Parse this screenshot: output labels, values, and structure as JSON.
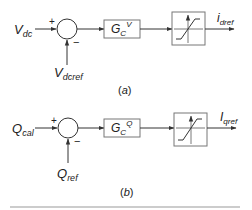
{
  "diagrams": [
    {
      "caption": "(a)",
      "input": {
        "main": "V",
        "sub": "dc"
      },
      "reference": {
        "main": "V",
        "sub": "dcref"
      },
      "sum_signs": {
        "top": "+",
        "bottom": "−"
      },
      "controller": {
        "main": "G",
        "sub": "C",
        "sup": "V"
      },
      "limiter": "saturation",
      "output": {
        "main": "i",
        "sub": "dref"
      }
    },
    {
      "caption": "(b)",
      "input": {
        "main": "Q",
        "sub": "cal"
      },
      "reference": {
        "main": "Q",
        "sub": "ref"
      },
      "sum_signs": {
        "top": "+",
        "bottom": "−"
      },
      "controller": {
        "main": "G",
        "sub": "C",
        "sup": "Q"
      },
      "limiter": "saturation",
      "output": {
        "main": "I",
        "sub": "qref"
      }
    }
  ],
  "colors": {
    "line": "#333333",
    "block_border": "#777777",
    "text": "#222222",
    "divider": "#999999"
  }
}
